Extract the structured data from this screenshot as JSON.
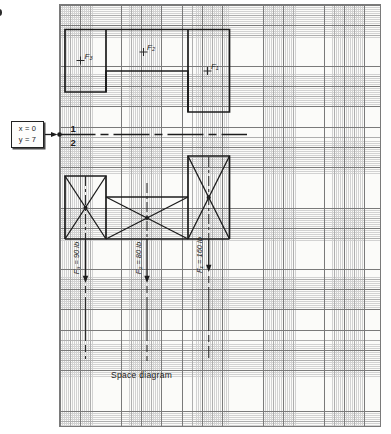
{
  "colors": {
    "ink": "#1c1c1c",
    "paper": "#fbfbf9",
    "grid_minor": "#d2d2d2",
    "grid_medium": "#aeaeae",
    "grid_major": "#7a7a7a"
  },
  "reference_box": {
    "line1": "x = 0",
    "line2": "y = 7"
  },
  "fold_line": {
    "top_label": "1",
    "bottom_label": "2"
  },
  "top_view": {
    "force_points": [
      {
        "label": "F₃"
      },
      {
        "label": "F₂"
      },
      {
        "label": "F₁"
      }
    ]
  },
  "space_diagram": {
    "caption": "Space diagram",
    "forces": [
      {
        "point": "F₃",
        "label": "F₃ = 90 lb",
        "magnitude_lb": 90
      },
      {
        "point": "F₂",
        "label": "F₂ = 80 lb",
        "magnitude_lb": 80
      },
      {
        "point": "F₁",
        "label": "F₁ = 160 lb",
        "magnitude_lb": 160
      }
    ]
  }
}
